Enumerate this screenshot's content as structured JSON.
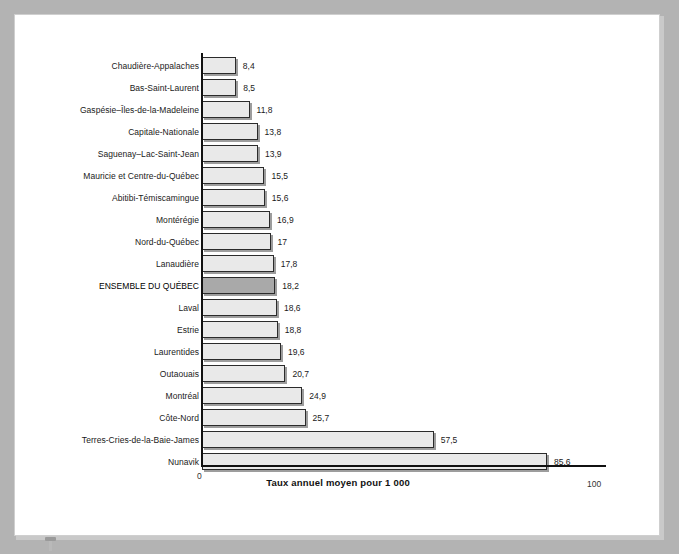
{
  "chart_data": {
    "type": "bar",
    "orientation": "horizontal",
    "title": "",
    "xlabel": "Taux annuel moyen pour 1 000",
    "ylabel": "",
    "xlim": [
      0,
      100
    ],
    "x_ticks": [
      "0",
      "100"
    ],
    "grid": false,
    "legend": null,
    "highlight_category": "ENSEMBLE DU QUÉBEC",
    "highlight_color": "#a9a9a9",
    "bar_color": "#e9e9e9",
    "bar_outline_color": "#2b2b2b",
    "categories": [
      "Chaudière-Appalaches",
      "Bas-Saint-Laurent",
      "Gaspésie–Îles-de-la-Madeleine",
      "Capitale-Nationale",
      "Saguenay–Lac-Saint-Jean",
      "Mauricie et Centre-du-Québec",
      "Abitibi-Témiscamingue",
      "Montérégie",
      "Nord-du-Québec",
      "Lanaudière",
      "ENSEMBLE DU QUÉBEC",
      "Laval",
      "Estrie",
      "Laurentides",
      "Outaouais",
      "Montréal",
      "Côte-Nord",
      "Terres-Cries-de-la-Baie-James",
      "Nunavik"
    ],
    "values": [
      8.4,
      8.5,
      11.8,
      13.8,
      13.9,
      15.5,
      15.6,
      16.9,
      17,
      17.8,
      18.2,
      18.6,
      18.8,
      19.6,
      20.7,
      24.9,
      25.7,
      57.5,
      85.6
    ],
    "value_labels": [
      "8,4",
      "8,5",
      "11,8",
      "13,8",
      "13,9",
      "15,5",
      "15,6",
      "16,9",
      "17",
      "17,8",
      "18,2",
      "18,6",
      "18,8",
      "19,6",
      "20,7",
      "24,9",
      "25,7",
      "57,5",
      "85,6"
    ]
  }
}
